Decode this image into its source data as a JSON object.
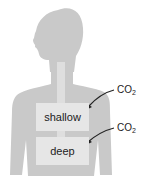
{
  "figure": {
    "body_color": "#c9c9c9",
    "airway_color": "#dedede",
    "box_color": "#e6e6e6",
    "regions": [
      {
        "label": "shallow"
      },
      {
        "label": "deep"
      }
    ],
    "arrows": [
      {
        "label_main": "CO",
        "label_sub": "2",
        "target": "shallow"
      },
      {
        "label_main": "CO",
        "label_sub": "2",
        "target": "deep"
      }
    ]
  }
}
